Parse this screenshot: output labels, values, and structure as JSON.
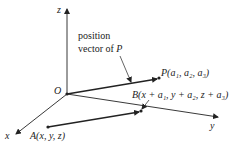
{
  "axes": {
    "x_label": "x",
    "y_label": "y",
    "z_label": "z",
    "origin_label": "O"
  },
  "annotation": {
    "line1": "position",
    "line2_prefix": "vector of ",
    "line2_var": "P"
  },
  "points": {
    "P": {
      "name": "P",
      "coords": "(a₁, a₂, a₃)"
    },
    "A": {
      "name": "A",
      "coords": "(x, y, z)"
    },
    "B": {
      "name": "B",
      "coords": "(x + a₁, y + a₂, z + a₃)"
    }
  },
  "colors": {
    "stroke": "#222222"
  }
}
